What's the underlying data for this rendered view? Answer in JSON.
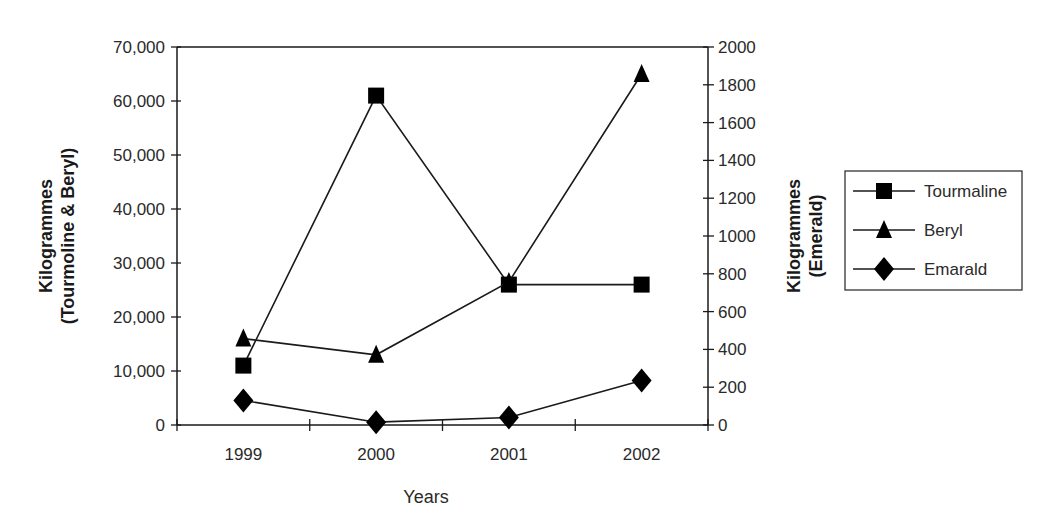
{
  "chart_data": {
    "type": "line",
    "title": "",
    "xlabel": "Years",
    "ylabel": "Kilogrammes (Tourmoline & Beryl)",
    "y2label": "Kilogrammes (Emerald)",
    "ylabel_lines": [
      "Kilogrammes",
      "(Tourmoline & Beryl)"
    ],
    "y2label_lines": [
      "Kilogrammes",
      "(Emerald)"
    ],
    "categories": [
      "1999",
      "2000",
      "2001",
      "2002"
    ],
    "ylim": [
      0,
      70000
    ],
    "y2lim": [
      0,
      2000
    ],
    "yticks": [
      "0",
      "10,000",
      "20,000",
      "30,000",
      "40,000",
      "50,000",
      "60,000",
      "70,000"
    ],
    "y2ticks": [
      "0",
      "200",
      "400",
      "600",
      "800",
      "1000",
      "1200",
      "1400",
      "1600",
      "1800",
      "2000"
    ],
    "grid": false,
    "legend_position": "right",
    "series": [
      {
        "name": "Tourmaline",
        "axis": "left",
        "marker": "square",
        "values": [
          11000,
          61000,
          26000,
          26000
        ]
      },
      {
        "name": "Beryl",
        "axis": "left",
        "marker": "triangle",
        "values": [
          16000,
          13000,
          26500,
          65000
        ]
      },
      {
        "name": "Emarald",
        "axis": "right",
        "marker": "diamond",
        "values": [
          130,
          15,
          40,
          235
        ]
      }
    ]
  },
  "colors": {
    "line": "#1a1a1a",
    "marker": "#000000",
    "background": "#ffffff"
  }
}
